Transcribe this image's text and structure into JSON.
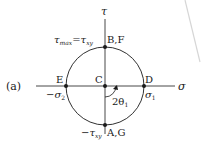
{
  "figure_label": "(a)",
  "axes": {
    "horizontal": "σ",
    "vertical": "τ"
  },
  "points": {
    "center": "C",
    "right": "D",
    "left": "E",
    "top": "B,F",
    "bottom": "A,G"
  },
  "annotations": {
    "top_lhs": "τ",
    "top_lhs_sub": "max",
    "top_eq": "=",
    "top_rhs": "τ",
    "top_rhs_sub": "xy",
    "right_value": "σ",
    "right_value_sub": "1",
    "left_value": "−σ",
    "left_value_sub": "2",
    "bottom_value": "−τ",
    "bottom_value_sub": "xy",
    "angle": "2θ",
    "angle_sub": "1"
  },
  "colors": {
    "ink": "#1a1a1a",
    "faint_mark": "#d0d0d0"
  }
}
